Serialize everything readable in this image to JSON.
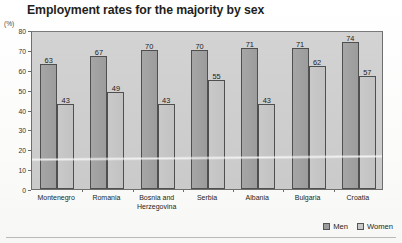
{
  "chart_data": {
    "type": "bar",
    "title": "Employment rates for the majority by sex",
    "unit_label": "(%)",
    "xlabel": "",
    "ylabel": "",
    "ylim": [
      0,
      80
    ],
    "yticks": [
      0,
      10,
      20,
      30,
      40,
      50,
      60,
      70,
      80
    ],
    "grid": false,
    "legend_position": "bottom-right",
    "categories": [
      "Montenegro",
      "Romania",
      "Bosnia and\nHerzegovina",
      "Serbia",
      "Albania",
      "Bulgaria",
      "Croatia"
    ],
    "series": [
      {
        "name": "Men",
        "color": "#9c9c9c",
        "values": [
          63,
          67,
          70,
          70,
          71,
          71,
          74
        ]
      },
      {
        "name": "Women",
        "color": "#c9c9c9",
        "values": [
          43,
          49,
          43,
          55,
          43,
          62,
          57
        ]
      }
    ]
  },
  "legend": {
    "items": [
      {
        "label": "Men"
      },
      {
        "label": "Women"
      }
    ]
  }
}
